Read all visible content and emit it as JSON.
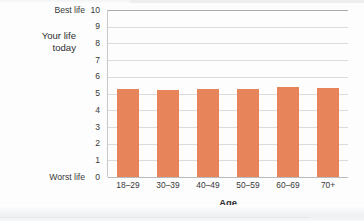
{
  "chart_data": {
    "type": "bar",
    "title": "",
    "categories": [
      "18–29",
      "30–39",
      "40–49",
      "50–59",
      "60–69",
      "70+"
    ],
    "values": [
      5.3,
      5.2,
      5.3,
      5.25,
      5.4,
      5.35
    ],
    "series": [
      {
        "name": "Your life today",
        "values": [
          5.3,
          5.2,
          5.3,
          5.25,
          5.4,
          5.35
        ]
      }
    ],
    "xlabel": "Age",
    "ylabel": "Your life today",
    "ylim": [
      0,
      10
    ],
    "yticks": [
      0,
      1,
      2,
      3,
      4,
      5,
      6,
      7,
      8,
      9,
      10
    ],
    "ytick_labels": [
      "0",
      "1",
      "2",
      "3",
      "4",
      "5",
      "6",
      "7",
      "8",
      "9",
      "10"
    ],
    "y_axis_annotations": {
      "top": "Best life",
      "bottom": "Worst life"
    },
    "grid": true,
    "legend": "none",
    "bar_color": "#e8845a"
  },
  "axes": {
    "y_title_line1": "Your life",
    "y_title_line2": "today",
    "x_title": "Age",
    "top_annotation": "Best life",
    "bottom_annotation": "Worst life"
  },
  "colors": {
    "bar": "#e8845a",
    "gridline": "#d9dbdd",
    "axis": "#b9bcbf",
    "text": "#38383a",
    "background": "#fdfdfd"
  }
}
